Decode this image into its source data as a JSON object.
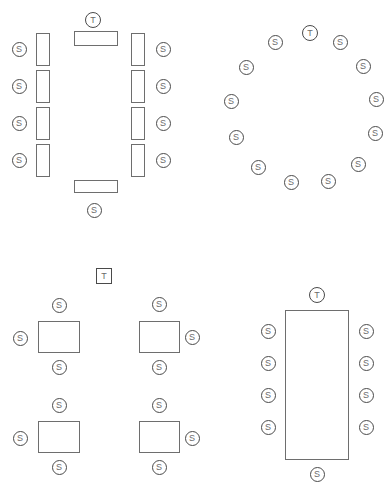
{
  "page": {
    "width": 389,
    "height": 485,
    "background": "#ffffff",
    "stroke_color": "#4a4a4a",
    "table_stroke_color": "#6e6e6e",
    "label_color": "#6b6b6b"
  },
  "labels": {
    "seat": "S",
    "head": "T"
  },
  "layouts": [
    {
      "name": "banquet-double-row",
      "x": 0,
      "y": 0,
      "width": 195,
      "height": 230,
      "seat_count": 9,
      "head_count": 1,
      "tables": [
        {
          "name": "table-top-cross",
          "x": 74,
          "y": 31,
          "w": 44,
          "h": 15
        },
        {
          "name": "table-left-1",
          "x": 36,
          "y": 33,
          "w": 14,
          "h": 33
        },
        {
          "name": "table-left-2",
          "x": 36,
          "y": 70,
          "w": 14,
          "h": 33
        },
        {
          "name": "table-left-3",
          "x": 36,
          "y": 107,
          "w": 14,
          "h": 33
        },
        {
          "name": "table-left-4",
          "x": 36,
          "y": 144,
          "w": 14,
          "h": 33
        },
        {
          "name": "table-right-1",
          "x": 131,
          "y": 33,
          "w": 14,
          "h": 33
        },
        {
          "name": "table-right-2",
          "x": 131,
          "y": 70,
          "w": 14,
          "h": 33
        },
        {
          "name": "table-right-3",
          "x": 131,
          "y": 107,
          "w": 14,
          "h": 33
        },
        {
          "name": "table-right-4",
          "x": 131,
          "y": 144,
          "w": 14,
          "h": 33
        },
        {
          "name": "table-bottom-cross",
          "x": 74,
          "y": 180,
          "w": 44,
          "h": 13
        }
      ],
      "markers": [
        {
          "name": "head-marker-top",
          "type": "head",
          "label": "T",
          "cx": 93,
          "cy": 20
        },
        {
          "name": "seat-left-1",
          "type": "seat",
          "label": "S",
          "cx": 19,
          "cy": 49
        },
        {
          "name": "seat-left-2",
          "type": "seat",
          "label": "S",
          "cx": 19,
          "cy": 86
        },
        {
          "name": "seat-left-3",
          "type": "seat",
          "label": "S",
          "cx": 19,
          "cy": 123
        },
        {
          "name": "seat-left-4",
          "type": "seat",
          "label": "S",
          "cx": 19,
          "cy": 160
        },
        {
          "name": "seat-right-1",
          "type": "seat",
          "label": "S",
          "cx": 163,
          "cy": 49
        },
        {
          "name": "seat-right-2",
          "type": "seat",
          "label": "S",
          "cx": 163,
          "cy": 86
        },
        {
          "name": "seat-right-3",
          "type": "seat",
          "label": "S",
          "cx": 163,
          "cy": 123
        },
        {
          "name": "seat-right-4",
          "type": "seat",
          "label": "S",
          "cx": 163,
          "cy": 160
        },
        {
          "name": "seat-bottom",
          "type": "seat",
          "label": "S",
          "cx": 94,
          "cy": 210
        }
      ]
    },
    {
      "name": "round-table-ring",
      "x": 195,
      "y": 0,
      "width": 194,
      "height": 230,
      "seat_count": 13,
      "head_count": 1,
      "tables": [],
      "markers": [
        {
          "name": "head-marker-ring",
          "type": "head",
          "label": "T",
          "cx": 115,
          "cy": 33
        },
        {
          "name": "seat-ring-1",
          "type": "seat",
          "label": "S",
          "cx": 80,
          "cy": 42
        },
        {
          "name": "seat-ring-2",
          "type": "seat",
          "label": "S",
          "cx": 51,
          "cy": 67
        },
        {
          "name": "seat-ring-3",
          "type": "seat",
          "label": "S",
          "cx": 36,
          "cy": 101
        },
        {
          "name": "seat-ring-4",
          "type": "seat",
          "label": "S",
          "cx": 41,
          "cy": 137
        },
        {
          "name": "seat-ring-5",
          "type": "seat",
          "label": "S",
          "cx": 63,
          "cy": 167
        },
        {
          "name": "seat-ring-6",
          "type": "seat",
          "label": "S",
          "cx": 96,
          "cy": 182
        },
        {
          "name": "seat-ring-7",
          "type": "seat",
          "label": "S",
          "cx": 133,
          "cy": 181
        },
        {
          "name": "seat-ring-8",
          "type": "seat",
          "label": "S",
          "cx": 163,
          "cy": 164
        },
        {
          "name": "seat-ring-9",
          "type": "seat",
          "label": "S",
          "cx": 180,
          "cy": 133
        },
        {
          "name": "seat-ring-10",
          "type": "seat",
          "label": "S",
          "cx": 181,
          "cy": 99
        },
        {
          "name": "seat-ring-11",
          "type": "seat",
          "label": "S",
          "cx": 168,
          "cy": 66
        },
        {
          "name": "seat-ring-12",
          "type": "seat",
          "label": "S",
          "cx": 145,
          "cy": 42
        }
      ]
    },
    {
      "name": "cabaret-four-squares",
      "x": 0,
      "y": 255,
      "width": 210,
      "height": 230,
      "seat_count": 12,
      "head_count": 1,
      "tables": [
        {
          "name": "square-table-top-left",
          "x": 38,
          "y": 66,
          "w": 42,
          "h": 32
        },
        {
          "name": "square-table-top-right",
          "x": 139,
          "y": 66,
          "w": 41,
          "h": 32
        },
        {
          "name": "square-table-bottom-left",
          "x": 38,
          "y": 166,
          "w": 42,
          "h": 32
        },
        {
          "name": "square-table-bottom-right",
          "x": 139,
          "y": 166,
          "w": 41,
          "h": 32
        }
      ],
      "markers": [
        {
          "name": "head-marker-square",
          "type": "head-square",
          "label": "T",
          "cx": 104,
          "cy": 21
        },
        {
          "name": "seat-tl-top",
          "type": "seat",
          "label": "S",
          "cx": 59,
          "cy": 50
        },
        {
          "name": "seat-tl-left",
          "type": "seat",
          "label": "S",
          "cx": 20,
          "cy": 83
        },
        {
          "name": "seat-tl-bottom",
          "type": "seat",
          "label": "S",
          "cx": 59,
          "cy": 112
        },
        {
          "name": "seat-tr-top",
          "type": "seat",
          "label": "S",
          "cx": 159,
          "cy": 49
        },
        {
          "name": "seat-tr-right",
          "type": "seat",
          "label": "S",
          "cx": 192,
          "cy": 82
        },
        {
          "name": "seat-tr-bottom",
          "type": "seat",
          "label": "S",
          "cx": 159,
          "cy": 112
        },
        {
          "name": "seat-bl-top",
          "type": "seat",
          "label": "S",
          "cx": 59,
          "cy": 150
        },
        {
          "name": "seat-bl-left",
          "type": "seat",
          "label": "S",
          "cx": 20,
          "cy": 183
        },
        {
          "name": "seat-bl-bottom",
          "type": "seat",
          "label": "S",
          "cx": 59,
          "cy": 212
        },
        {
          "name": "seat-br-top",
          "type": "seat",
          "label": "S",
          "cx": 159,
          "cy": 150
        },
        {
          "name": "seat-br-right",
          "type": "seat",
          "label": "S",
          "cx": 192,
          "cy": 183
        },
        {
          "name": "seat-br-bottom",
          "type": "seat",
          "label": "S",
          "cx": 159,
          "cy": 212
        }
      ]
    },
    {
      "name": "boardroom-long-table",
      "x": 250,
      "y": 280,
      "width": 139,
      "height": 205,
      "seat_count": 9,
      "head_count": 1,
      "tables": [
        {
          "name": "long-rectangular-table",
          "x": 35,
          "y": 30,
          "w": 64,
          "h": 150
        }
      ],
      "markers": [
        {
          "name": "head-marker-boardroom",
          "type": "head",
          "label": "T",
          "cx": 67,
          "cy": 15
        },
        {
          "name": "seat-board-left-1",
          "type": "seat",
          "label": "S",
          "cx": 18,
          "cy": 51
        },
        {
          "name": "seat-board-left-2",
          "type": "seat",
          "label": "S",
          "cx": 18,
          "cy": 83
        },
        {
          "name": "seat-board-left-3",
          "type": "seat",
          "label": "S",
          "cx": 18,
          "cy": 115
        },
        {
          "name": "seat-board-left-4",
          "type": "seat",
          "label": "S",
          "cx": 18,
          "cy": 147
        },
        {
          "name": "seat-board-right-1",
          "type": "seat",
          "label": "S",
          "cx": 116,
          "cy": 51
        },
        {
          "name": "seat-board-right-2",
          "type": "seat",
          "label": "S",
          "cx": 116,
          "cy": 83
        },
        {
          "name": "seat-board-right-3",
          "type": "seat",
          "label": "S",
          "cx": 116,
          "cy": 115
        },
        {
          "name": "seat-board-right-4",
          "type": "seat",
          "label": "S",
          "cx": 116,
          "cy": 147
        },
        {
          "name": "seat-board-bottom",
          "type": "seat",
          "label": "S",
          "cx": 67,
          "cy": 194
        }
      ]
    }
  ]
}
